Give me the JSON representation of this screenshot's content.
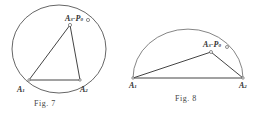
{
  "figures": [
    {
      "caption": "Fig. 7",
      "labels": {
        "a1": "A",
        "a1_sub": "1",
        "a2": "A",
        "a2_sub": "2",
        "a3": "A",
        "a3_sub": "3",
        "dash": "-",
        "p": "P",
        "p_sub": "0"
      }
    },
    {
      "caption": "Fig. 8",
      "labels": {
        "a1": "A",
        "a1_sub": "1",
        "a2": "A",
        "a2_sub": "2",
        "a3": "A",
        "a3_sub": "3",
        "dash": "-",
        "p": "P",
        "p_sub": "0"
      }
    }
  ],
  "colors": {
    "stroke": "#555555",
    "text": "#333333"
  }
}
